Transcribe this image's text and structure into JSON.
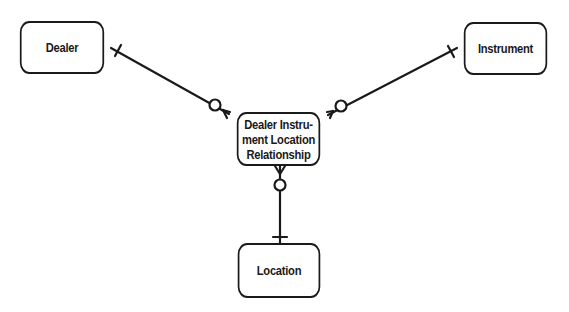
{
  "diagram": {
    "type": "entity-relationship",
    "notation": "crow's foot",
    "entities": [
      {
        "id": "dealer",
        "label": "Dealer"
      },
      {
        "id": "instrument",
        "label": "Instrument"
      },
      {
        "id": "relationship",
        "label_lines": [
          "Dealer Instru-",
          "ment Location",
          "Relationship"
        ]
      },
      {
        "id": "location",
        "label": "Location"
      }
    ],
    "relationships": [
      {
        "from": "dealer",
        "to": "relationship",
        "from_cardinality": "one",
        "to_cardinality": "zero-or-many"
      },
      {
        "from": "instrument",
        "to": "relationship",
        "from_cardinality": "one",
        "to_cardinality": "zero-or-many"
      },
      {
        "from": "location",
        "to": "relationship",
        "from_cardinality": "one",
        "to_cardinality": "zero-or-many"
      }
    ]
  },
  "colors": {
    "line": "#1a1a1a",
    "background": "#ffffff"
  }
}
